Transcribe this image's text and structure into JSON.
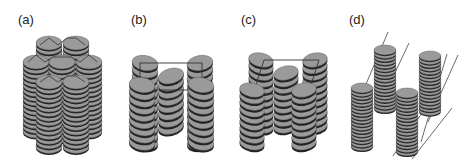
{
  "figure": {
    "panels": [
      {
        "id": "a",
        "label": "(a)",
        "description": "hexagonal columnar packing of discotic stacks"
      },
      {
        "id": "b",
        "label": "(b)",
        "description": "rectangular columnar phase with tilted discs"
      },
      {
        "id": "c",
        "label": "(c)",
        "description": "oblique columnar phase with tilted discs"
      },
      {
        "id": "d",
        "label": "(d)",
        "description": "columns arranged on parallel lattice lines"
      }
    ]
  },
  "colors": {
    "disc_face": "#9a9a9a",
    "disc_edge": "#222222",
    "lattice_line": "#444444",
    "label": "#222222"
  }
}
